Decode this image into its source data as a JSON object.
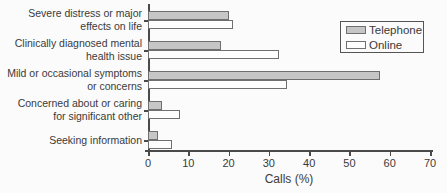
{
  "chart_data": {
    "type": "bar",
    "orientation": "horizontal",
    "title": "",
    "xlabel": "Calls (%)",
    "ylabel": "",
    "xlim": [
      0,
      70
    ],
    "xticks": [
      0,
      10,
      20,
      30,
      40,
      50,
      60,
      70
    ],
    "grid": false,
    "legend_position": "upper right",
    "categories": [
      [
        "Severe distress or major",
        "effects on life"
      ],
      [
        "Clinically diagnosed mental",
        "health issue"
      ],
      [
        "Mild or occasional symptoms",
        "or concerns"
      ],
      [
        "Concerned about or caring",
        "for significant other"
      ],
      [
        "Seeking information"
      ]
    ],
    "series": [
      {
        "name": "Telephone",
        "color": "#c6c6c6",
        "values": [
          20,
          18,
          57.5,
          3.5,
          2.5
        ]
      },
      {
        "name": "Online",
        "color": "#fdfdfd",
        "values": [
          21,
          32.5,
          34.5,
          8,
          6
        ]
      }
    ]
  },
  "colors": {
    "bar_border": "#6f6f6f",
    "axis": "#4a4a4a",
    "text": "#3a3a3a",
    "background": "#fbfbfb",
    "legend_border": "#555555"
  }
}
